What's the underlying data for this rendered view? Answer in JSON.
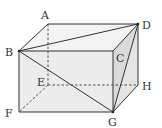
{
  "diagram": {
    "type": "cuboid",
    "vertices": {
      "A": {
        "label": "A",
        "x": 48,
        "y": 24
      },
      "B": {
        "label": "B",
        "x": 19,
        "y": 51
      },
      "C": {
        "label": "C",
        "x": 113,
        "y": 51
      },
      "D": {
        "label": "D",
        "x": 138,
        "y": 24
      },
      "E": {
        "label": "E",
        "x": 48,
        "y": 85
      },
      "F": {
        "label": "F",
        "x": 19,
        "y": 112
      },
      "G": {
        "label": "G",
        "x": 113,
        "y": 112
      },
      "H": {
        "label": "H",
        "x": 138,
        "y": 85
      }
    },
    "solid_edges": [
      "AB",
      "AD",
      "BC",
      "CD",
      "BF",
      "CG",
      "DH",
      "FG",
      "GH"
    ],
    "hidden_edges": [
      "AE",
      "EF",
      "EH"
    ],
    "diagonals": [
      "BD",
      "BG",
      "DG"
    ],
    "colors": {
      "front_face": "#ececec",
      "top_face": "#f2f2f2",
      "side_face": "#e2e2e2",
      "triangle_fill": "#d8d8d8",
      "edge": "#333333"
    }
  }
}
